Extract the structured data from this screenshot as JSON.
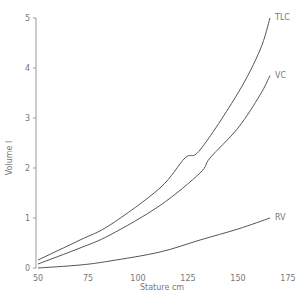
{
  "chart_data": {
    "type": "line",
    "title": "",
    "xlabel": "Stature cm",
    "ylabel": "Volume l",
    "xlim": [
      50,
      175
    ],
    "ylim": [
      0,
      5
    ],
    "xticks": [
      "50",
      "75",
      "100",
      "125",
      "150",
      "175"
    ],
    "yticks": [
      "0",
      "1",
      "2",
      "3",
      "4",
      "5"
    ],
    "grid": false,
    "legend": "inline-labels-at-line-ends",
    "series": [
      {
        "name": "TLC",
        "x": [
          50,
          71,
          86,
          111,
          123.5,
          131,
          150,
          161,
          166
        ],
        "y": [
          0.16,
          0.56,
          0.86,
          1.6,
          2.2,
          2.36,
          3.5,
          4.36,
          5.0
        ]
      },
      {
        "name": "VC",
        "x": [
          50,
          71,
          86,
          111,
          131,
          136,
          150,
          161,
          166
        ],
        "y": [
          0.08,
          0.4,
          0.66,
          1.25,
          1.9,
          2.2,
          2.8,
          3.46,
          3.85
        ]
      },
      {
        "name": "RV",
        "x": [
          50,
          71,
          86,
          111,
          131,
          150,
          166
        ],
        "y": [
          0.0,
          0.06,
          0.14,
          0.32,
          0.56,
          0.78,
          1.0
        ]
      }
    ]
  }
}
